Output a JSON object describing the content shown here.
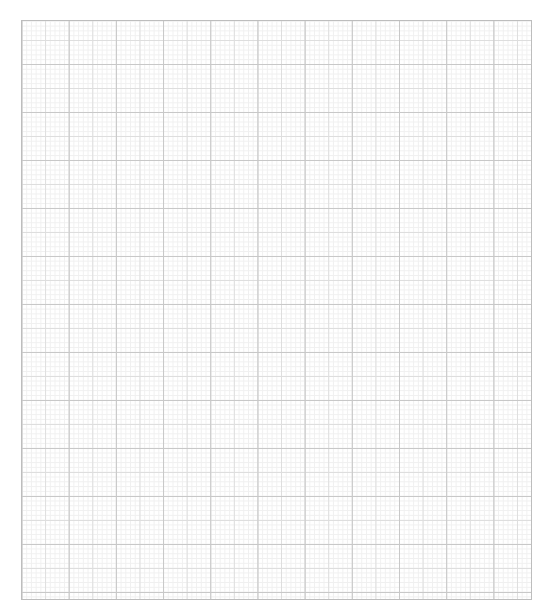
{
  "page": {
    "caption": "",
    "background_color": "#ffffff"
  },
  "graph_paper": {
    "columns_major": 11,
    "rows_major": 12,
    "subdivisions_per_major": 10,
    "major_line_color": "#c8c8c8",
    "medium_line_color": "#dedede",
    "fine_line_color": "#f0f0f0",
    "border_color": "#bdbdbd"
  }
}
